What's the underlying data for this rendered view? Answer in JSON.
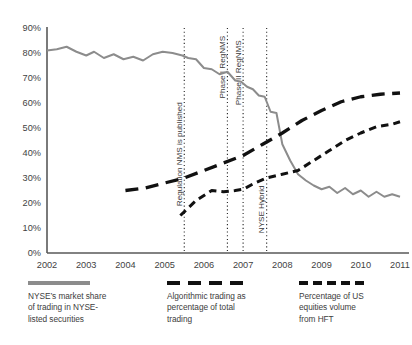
{
  "chart_data": {
    "type": "line",
    "title": "",
    "xlabel": "",
    "ylabel": "",
    "xlim": [
      2002,
      2011
    ],
    "ylim": [
      0,
      90
    ],
    "grid": false,
    "legend_position": "bottom",
    "y_ticks": [
      "0%",
      "10%",
      "20%",
      "30%",
      "40%",
      "50%",
      "60%",
      "70%",
      "80%",
      "90%"
    ],
    "y_tick_values": [
      0,
      10,
      20,
      30,
      40,
      50,
      60,
      70,
      80,
      90
    ],
    "x_ticks": [
      "2002",
      "2003",
      "2004",
      "2005",
      "2006",
      "2007",
      "2008",
      "2009",
      "2010",
      "2011"
    ],
    "x_tick_values": [
      2002,
      2003,
      2004,
      2005,
      2006,
      2007,
      2008,
      2009,
      2010,
      2011
    ],
    "series": [
      {
        "name": "NYSE's market share of trading in NYSE-listed securities",
        "style": "solid",
        "color": "#8c8c8c",
        "x": [
          2002.0,
          2002.25,
          2002.5,
          2002.75,
          2003.0,
          2003.2,
          2003.45,
          2003.7,
          2003.95,
          2004.2,
          2004.45,
          2004.7,
          2004.95,
          2005.2,
          2005.45,
          2005.6,
          2005.8,
          2006.0,
          2006.2,
          2006.4,
          2006.6,
          2006.8,
          2006.95,
          2007.1,
          2007.25,
          2007.4,
          2007.55,
          2007.7,
          2007.85,
          2008.0,
          2008.2,
          2008.4,
          2008.6,
          2008.8,
          2009.0,
          2009.2,
          2009.4,
          2009.6,
          2009.8,
          2010.0,
          2010.2,
          2010.4,
          2010.6,
          2010.8,
          2011.0
        ],
        "y": [
          81,
          81.5,
          82.5,
          80.5,
          79,
          80.5,
          78,
          79.5,
          77.5,
          78.5,
          77,
          79.5,
          80.5,
          80,
          79,
          78,
          77.5,
          74,
          73.5,
          71.5,
          72.5,
          69,
          68.5,
          66.5,
          65.5,
          63,
          62.5,
          56.5,
          56,
          43.5,
          37,
          31.5,
          29,
          27,
          25.5,
          26.5,
          24,
          26,
          23.5,
          25,
          22.5,
          24.5,
          22.5,
          23.5,
          22.5
        ]
      },
      {
        "name": "Algorithmic trading as percentage of total trading",
        "style": "long-dash",
        "color": "#111111",
        "x": [
          2004.0,
          2004.5,
          2005.0,
          2005.5,
          2006.0,
          2006.5,
          2007.0,
          2007.5,
          2008.0,
          2008.5,
          2009.0,
          2009.5,
          2010.0,
          2010.5,
          2011.0
        ],
        "y": [
          25,
          26,
          28,
          30,
          33,
          36,
          39,
          43.5,
          48,
          53,
          57,
          60.5,
          62.5,
          63.5,
          64
        ]
      },
      {
        "name": "Percentage of US equities volume from HFT",
        "style": "short-dash",
        "color": "#111111",
        "x": [
          2005.4,
          2005.8,
          2006.2,
          2006.5,
          2006.8,
          2007.0,
          2007.3,
          2007.6,
          2008.0,
          2008.4,
          2008.8,
          2009.2,
          2009.6,
          2010.0,
          2010.4,
          2010.8,
          2011.0
        ],
        "y": [
          15,
          21,
          25,
          24.5,
          25,
          25.5,
          28,
          30,
          31.5,
          33,
          37,
          41,
          45,
          48,
          50.5,
          51.5,
          52.5
        ]
      }
    ],
    "annotations": [
      {
        "label": "Regulation NMS is published",
        "x": 2005.5,
        "text_top_pct": 0.33
      },
      {
        "label": "Phase I RegNMS",
        "x": 2006.6,
        "text_top_pct": 0.035
      },
      {
        "label": "Phase II RegNMS",
        "x": 2007.0,
        "text_top_pct": 0.055
      },
      {
        "label": "NYSE Hybrid",
        "x": 2007.6,
        "text_top_pct": 0.7
      }
    ]
  },
  "legend": [
    {
      "label_lines": [
        "NYSE’s market share",
        "of trading in NYSE-",
        "listed securities"
      ],
      "style": "solid"
    },
    {
      "label_lines": [
        "Algorithmic trading as",
        "percentage of total",
        "trading"
      ],
      "style": "long-dash"
    },
    {
      "label_lines": [
        "Percentage of US",
        "equities volume",
        "from HFT"
      ],
      "style": "short-dash"
    }
  ]
}
